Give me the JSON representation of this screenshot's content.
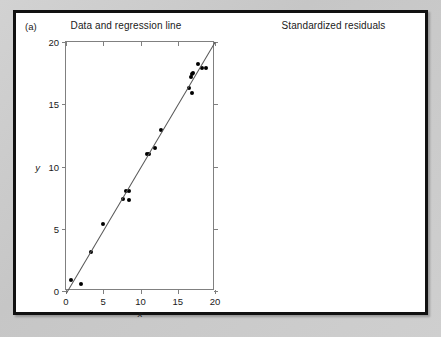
{
  "figure": {
    "panel_label": "(a)",
    "background_color": "#c9c9c9",
    "frame_color": "#111111",
    "point_color": "#000000",
    "line_color": "#555555",
    "axis_color": "#808080"
  },
  "chart_data": [
    {
      "type": "scatter",
      "title": "Data and regression line",
      "xlabel": "x",
      "ylabel": "y",
      "xlim": [
        0,
        20
      ],
      "ylim": [
        0,
        20
      ],
      "xticks": [
        0,
        5,
        10,
        15,
        20
      ],
      "yticks": [
        0,
        5,
        10,
        15,
        20
      ],
      "grid": false,
      "legend": "none",
      "points": [
        {
          "x": 0.7,
          "y": 0.9
        },
        {
          "x": 2.0,
          "y": 0.6
        },
        {
          "x": 3.4,
          "y": 3.1
        },
        {
          "x": 5.0,
          "y": 5.4
        },
        {
          "x": 7.7,
          "y": 7.4
        },
        {
          "x": 8.1,
          "y": 8.0
        },
        {
          "x": 8.4,
          "y": 8.0
        },
        {
          "x": 8.5,
          "y": 7.3
        },
        {
          "x": 10.9,
          "y": 11.0
        },
        {
          "x": 11.1,
          "y": 11.0
        },
        {
          "x": 11.9,
          "y": 11.5
        },
        {
          "x": 12.8,
          "y": 12.9
        },
        {
          "x": 16.5,
          "y": 16.3
        },
        {
          "x": 16.9,
          "y": 15.9
        },
        {
          "x": 16.8,
          "y": 17.2
        },
        {
          "x": 16.9,
          "y": 17.4
        },
        {
          "x": 17.1,
          "y": 17.5
        },
        {
          "x": 17.7,
          "y": 18.2
        },
        {
          "x": 18.2,
          "y": 17.9
        },
        {
          "x": 18.8,
          "y": 17.9
        }
      ],
      "regression_line": {
        "x0": 0.0,
        "y0": -0.2,
        "x1": 20.0,
        "y1": 20.0
      }
    },
    {
      "type": "scatter",
      "title": "Standardized residuals",
      "xlabel": "x",
      "ylabel": "",
      "xlim": [
        0,
        20
      ],
      "ylim": [
        -2.0,
        2.0
      ],
      "xticks": [
        0,
        5,
        10,
        15,
        20
      ],
      "yticks": [
        -2.0,
        -1.5,
        -1.0,
        -0.5,
        0.0,
        0.5,
        1.0,
        1.5,
        2.0
      ],
      "ytick_labels": [
        "-2.0",
        "-1.5",
        "-1.0",
        "-0.5",
        "0.0",
        "0.5",
        "1.0",
        "1.5",
        "2.0"
      ],
      "grid": false,
      "legend": "none",
      "reference_line_y": 0.0,
      "points": [
        {
          "x": 0.4,
          "y": 0.97
        },
        {
          "x": 2.0,
          "y": -1.52
        },
        {
          "x": 3.4,
          "y": -0.07
        },
        {
          "x": 5.0,
          "y": 0.87
        },
        {
          "x": 7.7,
          "y": 0.65
        },
        {
          "x": 8.1,
          "y": 0.37
        },
        {
          "x": 8.5,
          "y": -0.61
        },
        {
          "x": 8.6,
          "y": -1.22
        },
        {
          "x": 10.5,
          "y": 0.95
        },
        {
          "x": 11.4,
          "y": -0.14
        },
        {
          "x": 13.0,
          "y": -1.55
        },
        {
          "x": 13.7,
          "y": -0.48
        },
        {
          "x": 16.8,
          "y": 1.73
        },
        {
          "x": 16.7,
          "y": 1.33
        },
        {
          "x": 16.7,
          "y": 0.95
        },
        {
          "x": 16.8,
          "y": -0.36
        },
        {
          "x": 16.9,
          "y": -0.66
        },
        {
          "x": 16.9,
          "y": -1.04
        },
        {
          "x": 18.2,
          "y": -0.2
        },
        {
          "x": 18.8,
          "y": -0.73
        }
      ]
    }
  ]
}
